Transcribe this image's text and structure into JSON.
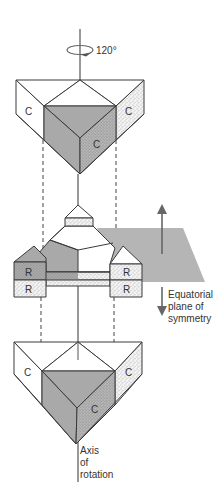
{
  "diagram": {
    "rotation_label": "120°",
    "top_trimer": {
      "subunit_labels": [
        "C",
        "C",
        "C"
      ]
    },
    "middle_trimer": {
      "subunit_labels": [
        "R",
        "R",
        "R",
        "R"
      ]
    },
    "bottom_trimer": {
      "subunit_labels": [
        "C",
        "C",
        "C"
      ]
    },
    "plane_label": [
      "Equatorial",
      "plane of",
      "symmetry"
    ],
    "axis_label": [
      "Axis",
      "of",
      "rotation"
    ],
    "colors": {
      "shade_dark": "#a9a9a9",
      "shade_plane": "#b5b5b5",
      "stipple_bg": "#f2f2f2",
      "line": "#3a3a3a"
    }
  }
}
